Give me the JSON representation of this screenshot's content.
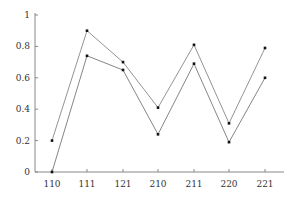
{
  "chart_data": {
    "type": "line",
    "title": "",
    "xlabel": "",
    "ylabel": "",
    "categories": [
      "110",
      "111",
      "121",
      "210",
      "211",
      "220",
      "221"
    ],
    "series": [
      {
        "name": "series-1",
        "style": "thin-dotted",
        "values": [
          0.2,
          0.9,
          0.7,
          0.41,
          0.81,
          0.31,
          0.79
        ]
      },
      {
        "name": "series-2",
        "style": "solid",
        "values": [
          0.0,
          0.74,
          0.65,
          0.24,
          0.69,
          0.19,
          0.6
        ]
      }
    ],
    "ylim": [
      0,
      1
    ],
    "yticks": [
      "0",
      "0.2",
      "0.4",
      "0.6",
      "0.8",
      "1"
    ],
    "grid": false,
    "legend": "none"
  },
  "colors": {
    "line": "#777777",
    "marker": "#111111",
    "axis": "#888888"
  }
}
